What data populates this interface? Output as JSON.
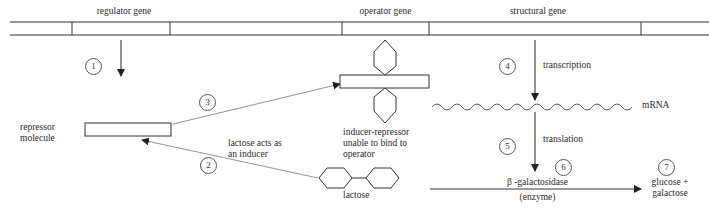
{
  "dna": {
    "labels": {
      "regulator": "regulator gene",
      "operator": "operator gene",
      "structural": "structural gene"
    }
  },
  "labels": {
    "repressor": [
      "repressor",
      "molecule"
    ],
    "inducer_repressor": [
      "inducer-repressor",
      "unable to bind to",
      "operator"
    ],
    "lactose_inducer": [
      "lactose acts as",
      "an inducer"
    ],
    "lactose": "lactose",
    "transcription": "transcription",
    "mrna": "mRNA",
    "translation": "translation",
    "enzyme_name": "β -galactosidase",
    "enzyme_type": "(enzyme)",
    "products": [
      "glucose +",
      "galactose"
    ]
  },
  "steps": [
    "1",
    "2",
    "3",
    "4",
    "5",
    "6",
    "7"
  ],
  "colors": {
    "line": "#333333",
    "light_line": "#888888"
  }
}
